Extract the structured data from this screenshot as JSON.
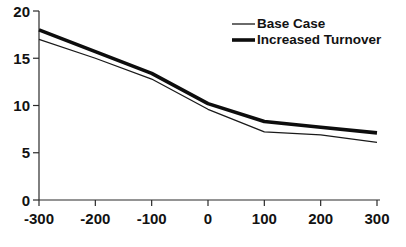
{
  "chart_data": {
    "type": "line",
    "title": "",
    "subtitle": "",
    "xlabel": "",
    "ylabel": "",
    "x": [
      -300,
      -200,
      -100,
      0,
      100,
      200,
      300
    ],
    "xtick_labels": [
      "-300",
      "-200",
      "-100",
      "0",
      "100",
      "200",
      "300"
    ],
    "ytick_labels": [
      "0",
      "5",
      "10",
      "15",
      "20"
    ],
    "yticks": [
      0,
      5,
      10,
      15,
      20
    ],
    "xlim": [
      -300,
      300
    ],
    "ylim": [
      0,
      20
    ],
    "grid": false,
    "legend_position": "top-right",
    "series": [
      {
        "name": "Base Case",
        "values": [
          17.0,
          15.0,
          12.8,
          9.6,
          7.2,
          6.9,
          6.1
        ],
        "line_width": 1.3,
        "color": "#1a1a1a"
      },
      {
        "name": "Increased Turnover",
        "values": [
          18.0,
          15.7,
          13.4,
          10.2,
          8.3,
          7.7,
          7.1
        ],
        "line_width": 3.6,
        "color": "#0d0d0d"
      }
    ]
  },
  "legend": {
    "entries": [
      {
        "label": "Base Case"
      },
      {
        "label": "Increased Turnover"
      }
    ]
  },
  "colors": {
    "background": "#ffffff",
    "axis": "#2a2a2a",
    "text": "#121212"
  }
}
